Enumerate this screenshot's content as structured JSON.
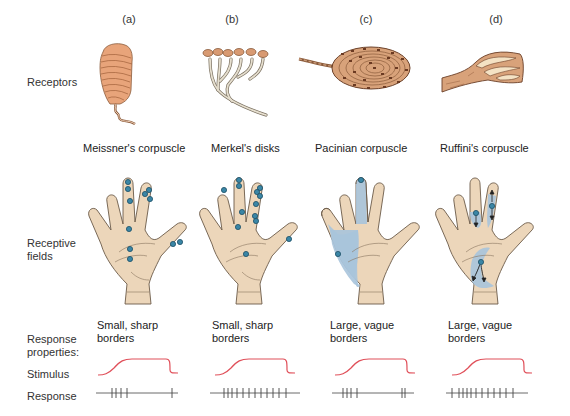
{
  "figure": {
    "columns": [
      {
        "letter": "(a)",
        "receptor": "Meissner's corpuscle",
        "receptive_field": "small",
        "properties_line1": "Small, sharp",
        "properties_line2": "borders",
        "adaptation": "rapid",
        "response_spikes": "burst at onset (4), single spike at offset"
      },
      {
        "letter": "(b)",
        "receptor": "Merkel's disks",
        "receptive_field": "small",
        "properties_line1": "Small, sharp",
        "properties_line2": "borders",
        "adaptation": "slow",
        "response_spikes": "sustained firing throughout stimulus"
      },
      {
        "letter": "(c)",
        "receptor": "Pacinian corpuscle",
        "receptive_field": "large",
        "properties_line1": "Large, vague",
        "properties_line2": "borders",
        "adaptation": "rapid",
        "response_spikes": "burst at onset (4), double spike at offset"
      },
      {
        "letter": "(d)",
        "receptor": "Ruffini's corpuscle",
        "receptive_field": "large",
        "properties_line1": "Large, vague",
        "properties_line2": "borders",
        "adaptation": "slow",
        "response_spikes": "sustained firing throughout stimulus"
      }
    ],
    "row_labels": {
      "receptors": "Receptors",
      "receptive_fields_line1": "Receptive",
      "receptive_fields_line2": "fields",
      "response_properties_line1": "Response",
      "response_properties_line2": "properties:",
      "stimulus": "Stimulus",
      "response": "Response"
    },
    "colors": {
      "skin": "#ecd6ba",
      "skin_outline": "#6b5a48",
      "field_blue": "#a9c4dc",
      "dot_fill": "#3a86a6",
      "dot_stroke": "#1d4f66",
      "stimulus_line": "#e0505a",
      "response_line": "#444444",
      "corpuscle_orange": "#e8a47a",
      "corpuscle_brown": "#8a5a3a",
      "merkel_gray": "#d9d2c2"
    }
  }
}
